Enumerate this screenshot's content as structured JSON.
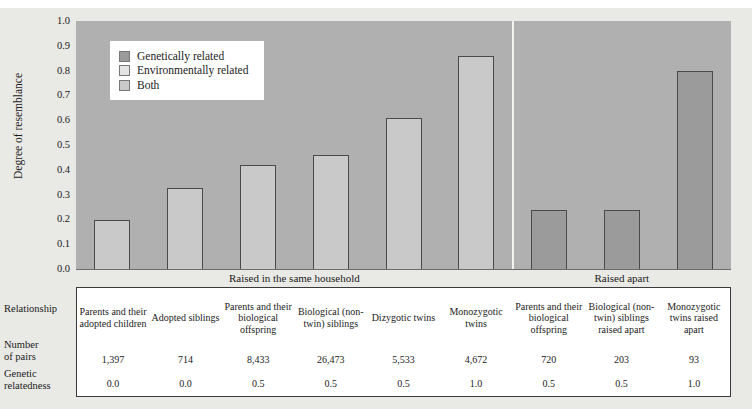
{
  "axis": {
    "y_title": "Degree of resemblance",
    "y_ticks": [
      "1.0",
      "0.9",
      "0.8",
      "0.7",
      "0.6",
      "0.5",
      "0.4",
      "0.3",
      "0.2",
      "0.1",
      "0.0"
    ]
  },
  "legend": {
    "items": [
      {
        "label": "Genetically related",
        "color": "#9b9b9b"
      },
      {
        "label": "Environmentally related",
        "color": "#e4e4e4"
      },
      {
        "label": "Both",
        "color": "#c9c9c9"
      }
    ]
  },
  "groups": [
    {
      "caption": "Raised in the same household"
    },
    {
      "caption": "Raised apart"
    }
  ],
  "table": {
    "row_labels": [
      "Relationship",
      "Number\nof pairs",
      "Genetic\nrelatedness"
    ],
    "row_label_relationship": "Relationship",
    "row_label_pairs_line1": "Number",
    "row_label_pairs_line2": "of pairs",
    "row_label_relatedness_line1": "Genetic",
    "row_label_relatedness_line2": "relatedness",
    "columns": [
      {
        "relationship": "Parents and their adopted children",
        "pairs": "1,397",
        "relatedness": "0.0"
      },
      {
        "relationship": "Adopted siblings",
        "pairs": "714",
        "relatedness": "0.0"
      },
      {
        "relationship": "Parents and their biological offspring",
        "pairs": "8,433",
        "relatedness": "0.5"
      },
      {
        "relationship": "Biological (non-twin) siblings",
        "pairs": "26,473",
        "relatedness": "0.5"
      },
      {
        "relationship": "Dizygotic twins",
        "pairs": "5,533",
        "relatedness": "0.5"
      },
      {
        "relationship": "Monozygotic twins",
        "pairs": "4,672",
        "relatedness": "1.0"
      },
      {
        "relationship": "Parents and their biological offspring",
        "pairs": "720",
        "relatedness": "0.5"
      },
      {
        "relationship": "Biological (non-twin) siblings raised apart",
        "pairs": "203",
        "relatedness": "0.5"
      },
      {
        "relationship": "Monozygotic twins raised apart",
        "pairs": "93",
        "relatedness": "1.0"
      }
    ]
  },
  "chart_data": {
    "type": "bar",
    "title": "",
    "xlabel": "",
    "ylabel": "Degree of resemblance",
    "ylim": [
      0.0,
      1.0
    ],
    "ytick_step": 0.1,
    "grid": false,
    "legend_position": "top-left-inside",
    "categories": [
      "Parents and their adopted children",
      "Adopted siblings",
      "Parents and their biological offspring",
      "Biological (non-twin) siblings",
      "Dizygotic twins",
      "Monozygotic twins",
      "Parents and their biological offspring",
      "Biological (non-twin) siblings raised apart",
      "Monozygotic twins raised apart"
    ],
    "values": [
      0.2,
      0.33,
      0.42,
      0.46,
      0.61,
      0.86,
      0.24,
      0.24,
      0.8
    ],
    "bar_kinds": [
      "both",
      "environmentally",
      "both",
      "both",
      "both",
      "both",
      "genetically",
      "genetically",
      "genetically"
    ],
    "groups": [
      {
        "caption": "Raised in the same household",
        "indices": [
          0,
          1,
          2,
          3,
          4,
          5
        ]
      },
      {
        "caption": "Raised apart",
        "indices": [
          6,
          7,
          8
        ]
      }
    ]
  },
  "colors": {
    "plot_background": "#b0b0b0",
    "page_background": "#e9e9e5",
    "bar_light": "#c9c9c9",
    "bar_dark": "#9b9b9b",
    "bar_outline": "#4a4a4a"
  }
}
